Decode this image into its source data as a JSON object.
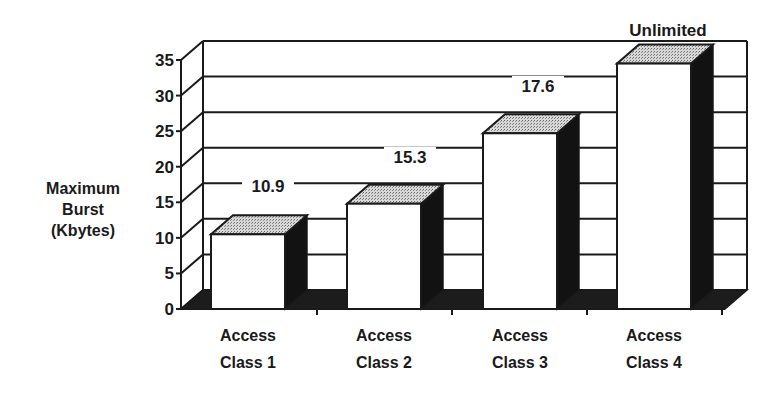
{
  "chart_data": {
    "type": "bar",
    "style": "3d",
    "title": "",
    "xlabel": "",
    "ylabel": "Maximum Burst (Kbytes)",
    "ylabel_lines": [
      "Maximum",
      "Burst",
      "(Kbytes)"
    ],
    "ylim": [
      0,
      35
    ],
    "yticks": [
      0,
      5,
      10,
      15,
      20,
      25,
      30,
      35
    ],
    "grid": true,
    "categories": [
      "Access Class 1",
      "Access Class 2",
      "Access Class 3",
      "Access Class 4"
    ],
    "category_lines": [
      [
        "Access",
        "Class 1"
      ],
      [
        "Access",
        "Class 2"
      ],
      [
        "Access",
        "Class 3"
      ],
      [
        "Access",
        "Class 4"
      ]
    ],
    "values": [
      10.5,
      14.8,
      24.7,
      34.5
    ],
    "annotations": [
      "10.9",
      "15.3",
      "17.6",
      "Unlimited"
    ],
    "annotation_positions_y": [
      17.5,
      22.5,
      32.5,
      38
    ],
    "legend": null,
    "colors": {
      "bar_front": "#ffffff",
      "bar_top": "#bdbdbd",
      "bar_side": "#111111",
      "floor": "#1a1a1a",
      "grid": "#1a1a1a"
    }
  }
}
